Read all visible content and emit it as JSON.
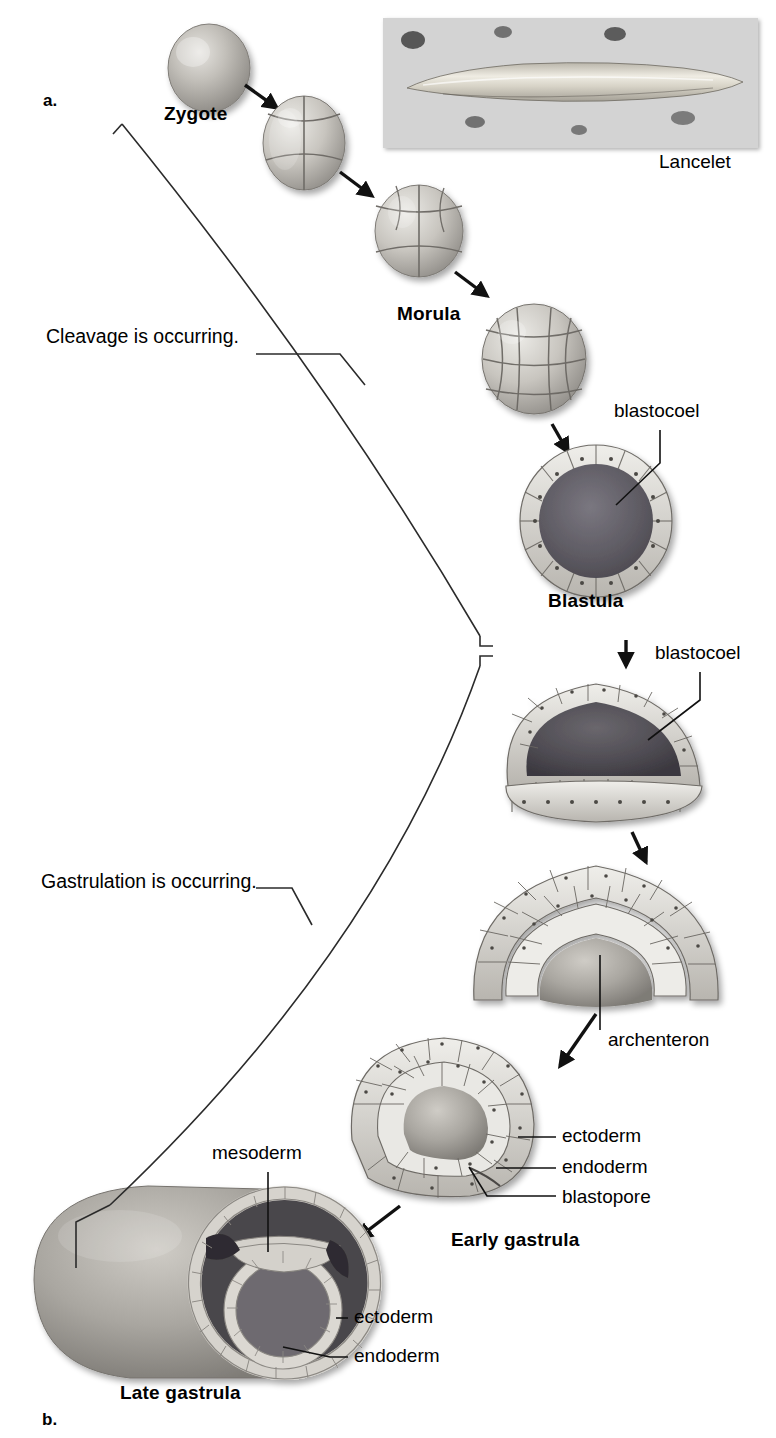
{
  "figure": {
    "panel_a_letter": "a.",
    "panel_b_letter": "b.",
    "photo_caption": "Lancelet"
  },
  "phases": [
    {
      "id": "cleavage",
      "text": "Cleavage is occurring."
    },
    {
      "id": "gastrulation",
      "text": "Gastrulation is occurring."
    }
  ],
  "stages": [
    {
      "id": "zygote",
      "label": "Zygote"
    },
    {
      "id": "morula",
      "label": "Morula"
    },
    {
      "id": "blastula",
      "label": "Blastula"
    },
    {
      "id": "early_gastrula",
      "label": "Early gastrula"
    },
    {
      "id": "late_gastrula",
      "label": "Late gastrula"
    }
  ],
  "callouts": {
    "blastocoel_blastula": "blastocoel",
    "blastocoel_gastrula": "blastocoel",
    "archenteron": "archenteron",
    "early_ectoderm": "ectoderm",
    "early_endoderm": "endoderm",
    "early_blastopore": "blastopore",
    "late_mesoderm": "mesoderm",
    "late_ectoderm": "ectoderm",
    "late_endoderm": "endoderm"
  },
  "colors": {
    "background": "#ffffff",
    "ink": "#000000",
    "line": "#2b2b2b",
    "embryo_light": "#d8d6d2",
    "embryo_mid": "#a9a6a1",
    "embryo_dark": "#6e6b67",
    "cavity_dark": "#59565a",
    "photo_gravel": "#8a8a8a",
    "photo_body": "#d9d6cd"
  }
}
